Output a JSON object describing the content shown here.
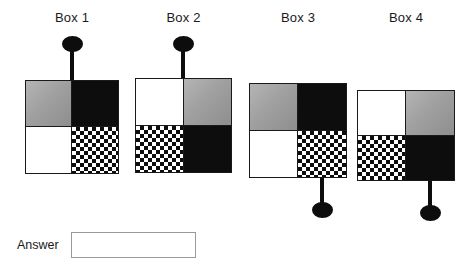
{
  "page": {
    "background_color": "#ffffff",
    "ink_color": "#1a1a1a"
  },
  "palette": {
    "black": "#0d0d0d",
    "white": "#ffffff",
    "gray": "#9d9d9d",
    "checker_light": "#ffffff",
    "checker_dark": "#0d0d0d",
    "input_border": "#999999"
  },
  "boxes": [
    {
      "label": "Box 1",
      "pin_position": "top",
      "pin_quadrant": "top-left-right-edge",
      "quadrants": {
        "top_left": "gray",
        "top_right": "black",
        "bottom_left": "white",
        "bottom_right": "checker"
      }
    },
    {
      "label": "Box 2",
      "pin_position": "top",
      "pin_quadrant": "top-left-right-edge",
      "quadrants": {
        "top_left": "white",
        "top_right": "gray",
        "bottom_left": "checker",
        "bottom_right": "black"
      }
    },
    {
      "label": "Box 3",
      "pin_position": "bottom",
      "pin_quadrant": "bottom-right-center",
      "quadrants": {
        "top_left": "gray",
        "top_right": "black",
        "bottom_left": "white",
        "bottom_right": "checker"
      }
    },
    {
      "label": "Box 4",
      "pin_position": "bottom",
      "pin_quadrant": "bottom-right-center",
      "quadrants": {
        "top_left": "white",
        "top_right": "gray",
        "bottom_left": "checker",
        "bottom_right": "black"
      }
    }
  ],
  "answer": {
    "label": "Answer",
    "value": "",
    "placeholder": ""
  }
}
